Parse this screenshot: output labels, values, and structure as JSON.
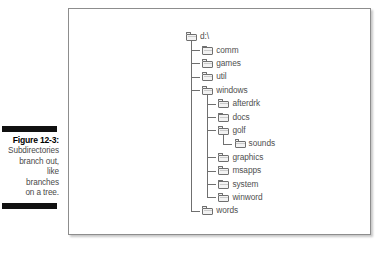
{
  "caption": {
    "figure_label": "Figure 12-3:",
    "lines": [
      "Subdirectories",
      "branch out,",
      "like",
      "branches",
      "on a tree."
    ]
  },
  "figure": {
    "type": "directory-tree",
    "root": "d:\\",
    "tree": [
      {
        "name": "d:\\",
        "depth": 0,
        "icon": "folder-icon"
      },
      {
        "name": "comm",
        "depth": 1,
        "icon": "folder-icon"
      },
      {
        "name": "games",
        "depth": 1,
        "icon": "folder-icon"
      },
      {
        "name": "util",
        "depth": 1,
        "icon": "folder-icon"
      },
      {
        "name": "windows",
        "depth": 1,
        "icon": "folder-icon"
      },
      {
        "name": "afterdrk",
        "depth": 2,
        "icon": "folder-icon"
      },
      {
        "name": "docs",
        "depth": 2,
        "icon": "folder-icon"
      },
      {
        "name": "golf",
        "depth": 2,
        "icon": "folder-icon"
      },
      {
        "name": "sounds",
        "depth": 3,
        "icon": "folder-icon"
      },
      {
        "name": "graphics",
        "depth": 2,
        "icon": "folder-icon"
      },
      {
        "name": "msapps",
        "depth": 2,
        "icon": "folder-icon"
      },
      {
        "name": "system",
        "depth": 2,
        "icon": "folder-icon"
      },
      {
        "name": "winword",
        "depth": 2,
        "icon": "folder-icon"
      },
      {
        "name": "words",
        "depth": 1,
        "icon": "folder-icon"
      }
    ]
  },
  "colors": {
    "rule": "#111111",
    "panel_border": "#8d8d8d",
    "tree_line": "#6f6f6f",
    "label_text": "#4f4f4f",
    "caption_text": "#4a4a4a"
  }
}
